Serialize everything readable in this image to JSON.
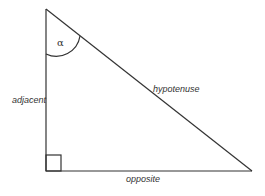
{
  "diagram": {
    "labels": {
      "angle": "α",
      "adjacent": "adjacent",
      "hypotenuse": "hypotenuse",
      "opposite": "opposite"
    },
    "colors": {
      "stroke": "#333333",
      "background": "#ffffff"
    }
  }
}
